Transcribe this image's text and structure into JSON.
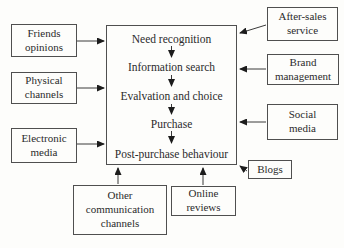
{
  "process": {
    "stages": [
      "Need recognition",
      "Information search",
      "Evalvation and choice",
      "Purchase",
      "Post-purchase behaviour"
    ]
  },
  "influencers": {
    "friends_opinions": "Friends\nopinions",
    "physical_channels": "Physical\nchannels",
    "electronic_media": "Electronic\nmedia",
    "after_sales_service": "After-sales\nservice",
    "brand_management": "Brand\nmanagement",
    "social_media": "Social\nmedia",
    "blogs": "Blogs",
    "other_communication_channels": "Other\ncommunication\nchannels",
    "online_reviews": "Online\nreviews"
  },
  "colors": {
    "text": "#2b2b2b",
    "border": "#4f4f4f",
    "arrow_line": "#3a3a3a",
    "arrow_head": "#1c1c1c",
    "background": "#fdfdfb"
  }
}
